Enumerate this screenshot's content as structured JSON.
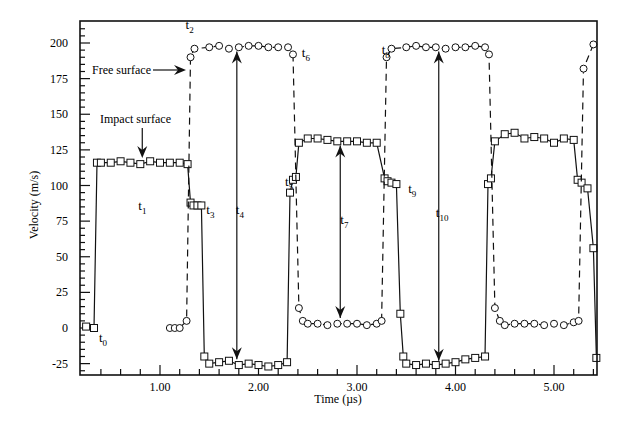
{
  "chart_data": {
    "type": "line",
    "title": "",
    "xlabel": "Time (µs)",
    "ylabel": "Velocity (m/s)",
    "xlim": [
      0.2,
      5.45
    ],
    "ylim": [
      -35,
      215
    ],
    "xticks": [
      1.0,
      2.0,
      3.0,
      4.0,
      5.0
    ],
    "xtick_labels": [
      "1.00",
      "2.00",
      "3.00",
      "4.00",
      "5.00"
    ],
    "yticks": [
      -25,
      0,
      25,
      50,
      75,
      100,
      125,
      150,
      175,
      200
    ],
    "ytick_labels": [
      "-25",
      "0",
      "25",
      "50",
      "75",
      "100",
      "125",
      "150",
      "175",
      "200"
    ],
    "grid": false,
    "legend": null,
    "series": [
      {
        "name": "Impact surface",
        "marker": "square",
        "linestyle": "solid",
        "x": [
          0.25,
          0.33,
          0.36,
          0.4,
          0.5,
          0.6,
          0.7,
          0.8,
          0.9,
          1.0,
          1.1,
          1.2,
          1.28,
          1.31,
          1.34,
          1.38,
          1.42,
          1.45,
          1.5,
          1.6,
          1.7,
          1.8,
          1.9,
          2.0,
          2.1,
          2.2,
          2.29,
          2.32,
          2.35,
          2.38,
          2.41,
          2.5,
          2.6,
          2.7,
          2.8,
          2.9,
          3.0,
          3.1,
          3.2,
          3.28,
          3.31,
          3.35,
          3.4,
          3.44,
          3.47,
          3.5,
          3.6,
          3.7,
          3.8,
          3.9,
          4.0,
          4.1,
          4.2,
          4.3,
          4.33,
          4.36,
          4.4,
          4.5,
          4.6,
          4.7,
          4.8,
          4.9,
          5.0,
          5.1,
          5.2,
          5.24,
          5.28,
          5.34,
          5.4,
          5.43
        ],
        "y": [
          1,
          0,
          116,
          116,
          116,
          117,
          116,
          115,
          117,
          116,
          116,
          116,
          115,
          88,
          86,
          86,
          86,
          -20,
          -25,
          -24,
          -23,
          -26,
          -25,
          -26,
          -27,
          -26,
          -24,
          95,
          104,
          106,
          130,
          133,
          133,
          132,
          131,
          131,
          131,
          130,
          130,
          105,
          103,
          102,
          101,
          10,
          -20,
          -25,
          -26,
          -25,
          -26,
          -25,
          -24,
          -22,
          -21,
          -20,
          101,
          105,
          131,
          136,
          137,
          133,
          134,
          133,
          130,
          133,
          132,
          104,
          102,
          98,
          56,
          -21
        ]
      },
      {
        "name": "Free surface",
        "marker": "circle",
        "linestyle": "dashed",
        "x": [
          1.1,
          1.15,
          1.2,
          1.27,
          1.31,
          1.35,
          1.5,
          1.6,
          1.7,
          1.8,
          1.9,
          2.0,
          2.1,
          2.2,
          2.3,
          2.35,
          2.41,
          2.45,
          2.5,
          2.6,
          2.7,
          2.8,
          2.9,
          3.0,
          3.1,
          3.2,
          3.25,
          3.3,
          3.35,
          3.5,
          3.6,
          3.7,
          3.8,
          3.9,
          4.0,
          4.1,
          4.2,
          4.3,
          4.34,
          4.4,
          4.45,
          4.5,
          4.6,
          4.7,
          4.8,
          4.9,
          5.0,
          5.1,
          5.2,
          5.25,
          5.3,
          5.4
        ],
        "y": [
          0,
          0,
          0,
          5,
          190,
          196,
          197,
          198,
          196,
          197,
          198,
          198,
          197,
          197,
          197,
          192,
          14,
          5,
          3,
          3,
          2,
          3,
          3,
          3,
          2,
          3,
          5,
          190,
          196,
          197,
          198,
          197,
          197,
          196,
          197,
          197,
          198,
          197,
          192,
          14,
          5,
          2,
          3,
          3,
          3,
          2,
          3,
          2,
          4,
          5,
          182,
          199
        ]
      }
    ],
    "annotations": [
      {
        "text": "t0",
        "x": 0.38,
        "y": -10
      },
      {
        "text": "t1",
        "x": 0.78,
        "y": 83
      },
      {
        "text": "t2",
        "x": 1.26,
        "y": 210
      },
      {
        "text": "t3",
        "x": 1.47,
        "y": 80
      },
      {
        "text": "t4",
        "x": 1.77,
        "y": 80
      },
      {
        "text": "t5",
        "x": 2.27,
        "y": 100
      },
      {
        "text": "t6",
        "x": 2.44,
        "y": 190
      },
      {
        "text": "t7",
        "x": 2.83,
        "y": 73
      },
      {
        "text": "t8",
        "x": 3.25,
        "y": 192
      },
      {
        "text": "t9",
        "x": 3.52,
        "y": 95
      },
      {
        "text": "t10",
        "x": 3.8,
        "y": 78
      },
      {
        "text": "Free surface",
        "arrow_to": [
          1.3,
          180
        ]
      },
      {
        "text": "Impact surface",
        "arrow_to": [
          0.82,
          120
        ]
      }
    ]
  },
  "labels": {
    "xlabel": "Time (µs)",
    "ylabel": "Velocity (m/s)",
    "free_surface": "Free surface",
    "impact_surface": "Impact surface"
  }
}
